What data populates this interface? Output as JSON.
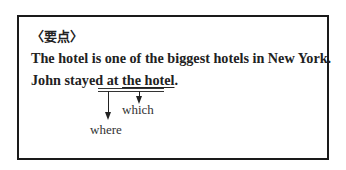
{
  "box": {
    "heading": "〈要点〉",
    "sentence1": "The hotel is one of the biggest hotels in New York.",
    "sentence2_prefix": "John stayed at ",
    "sentence2_underlined": "the hotel",
    "sentence2_suffix": ".",
    "labels": {
      "which": "which",
      "where": "where"
    }
  }
}
